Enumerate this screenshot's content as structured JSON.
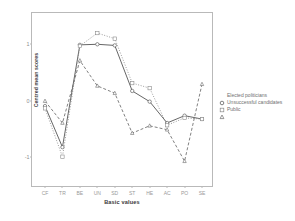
{
  "chart_data": {
    "type": "line",
    "title": "",
    "xlabel": "Basic values",
    "ylabel": "Centred mean scores",
    "categories": [
      "CF",
      "TR",
      "BE",
      "UN",
      "SD",
      "ST",
      "HE",
      "AC",
      "PO",
      "SE"
    ],
    "ylim": [
      -1.45,
      1.45
    ],
    "yticks": [
      1,
      0,
      -1
    ],
    "ytick_labels": [
      "1",
      "0",
      "-1"
    ],
    "grid": false,
    "legend_position": "right",
    "series": [
      {
        "name": "Elected politicians",
        "marker": "circle",
        "line_style": "solid",
        "color": "#4a4a4a",
        "values": [
          -0.1,
          -0.83,
          0.99,
          1.0,
          0.98,
          0.17,
          -0.02,
          -0.4,
          -0.27,
          -0.33
        ]
      },
      {
        "name": "Unsuccessful candidates",
        "marker": "square",
        "line_style": "dotted",
        "color": "#8a8a8a",
        "values": [
          -0.14,
          -1.0,
          0.97,
          1.2,
          1.1,
          0.31,
          0.22,
          -0.44,
          -0.31,
          -0.33
        ]
      },
      {
        "name": "Public",
        "marker": "triangle",
        "line_style": "dashed",
        "color": "#6a6a6a",
        "values": [
          -0.01,
          -0.4,
          0.71,
          0.26,
          0.13,
          -0.58,
          -0.45,
          -0.52,
          -1.08,
          0.29
        ]
      }
    ]
  },
  "axes": {
    "y_title": "Centred mean scores",
    "x_title": "Basic values"
  },
  "legend": {
    "entries": [
      {
        "label": "Elected politicians",
        "marker": "circle"
      },
      {
        "label": "Unsuccessful candidates",
        "marker": "square"
      },
      {
        "label": "Public",
        "marker": "triangle"
      }
    ]
  }
}
